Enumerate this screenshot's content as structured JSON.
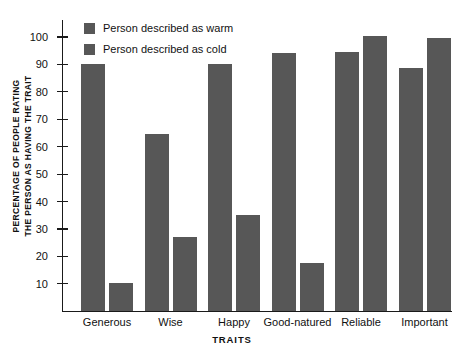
{
  "chart_data": {
    "type": "bar",
    "title": "",
    "subtitle": "",
    "xlabel": "TRAITS",
    "ylabel": "PERCENTAGE OF PEOPLE RATING THE PERSON AS HAVING THE TRAIT",
    "ylabel_lines": [
      "PERCENTAGE OF PEOPLE RATING",
      "THE PERSON AS HAVING THE TRAIT"
    ],
    "categories": [
      "Generous",
      "Wise",
      "Happy",
      "Good-natured",
      "Reliable",
      "Important"
    ],
    "series": [
      {
        "name": "Person described as warm",
        "color": "#575757",
        "values": [
          90,
          64.5,
          90,
          94,
          94.5,
          88.5
        ]
      },
      {
        "name": "Person described as cold",
        "color": "#575757",
        "values": [
          10,
          27,
          35,
          17.5,
          100,
          99.5
        ]
      }
    ],
    "ylim": [
      0,
      106
    ],
    "yticks": [
      10,
      20,
      30,
      40,
      50,
      60,
      70,
      80,
      90,
      100
    ],
    "ytick_labels": [
      "10",
      "20",
      "30",
      "40",
      "50",
      "60",
      "70",
      "80",
      "90",
      "100"
    ],
    "grid": false,
    "legend_position": "top-left-inside",
    "bar_color": "#575757",
    "axis_color": "#1a1a1a",
    "background": "#ffffff"
  },
  "legend": {
    "entries": [
      {
        "label": "Person described as warm",
        "swatch": "#575757"
      },
      {
        "label": "Person described as cold",
        "swatch": "#575757"
      }
    ]
  }
}
